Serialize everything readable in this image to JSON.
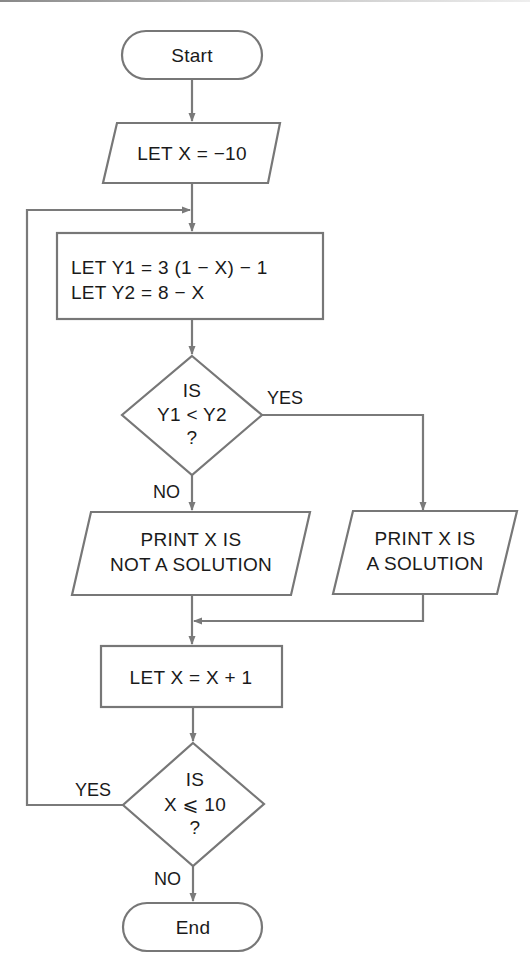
{
  "diagram": {
    "type": "flowchart",
    "colors": {
      "stroke": "#777777",
      "text": "#1a1a1a",
      "background": "#ffffff"
    },
    "nodes": {
      "start": {
        "shape": "terminal",
        "label": "Start"
      },
      "init": {
        "shape": "parallelogram",
        "label": "LET X = −10"
      },
      "compute": {
        "shape": "rectangle",
        "lines": [
          "LET Y1 = 3 (1 − X) − 1",
          "LET Y2 = 8 − X"
        ]
      },
      "decision1": {
        "shape": "diamond",
        "lines": [
          "IS",
          "Y1 < Y2",
          "?"
        ]
      },
      "not_solution": {
        "shape": "parallelogram",
        "lines": [
          "PRINT X IS",
          "NOT A SOLUTION"
        ]
      },
      "solution": {
        "shape": "parallelogram",
        "lines": [
          "PRINT X IS",
          "A SOLUTION"
        ]
      },
      "increment": {
        "shape": "rectangle",
        "label": "LET X = X + 1"
      },
      "decision2": {
        "shape": "diamond",
        "lines": [
          "IS",
          "X ⩽ 10",
          "?"
        ]
      },
      "end": {
        "shape": "terminal",
        "label": "End"
      }
    },
    "edge_labels": {
      "decision1_yes": "YES",
      "decision1_no": "NO",
      "decision2_yes": "YES",
      "decision2_no": "NO"
    },
    "edges": [
      {
        "from": "start",
        "to": "init"
      },
      {
        "from": "init",
        "to": "compute"
      },
      {
        "from": "compute",
        "to": "decision1"
      },
      {
        "from": "decision1",
        "to": "solution",
        "label": "YES"
      },
      {
        "from": "decision1",
        "to": "not_solution",
        "label": "NO"
      },
      {
        "from": "not_solution",
        "to": "increment"
      },
      {
        "from": "solution",
        "to": "increment"
      },
      {
        "from": "increment",
        "to": "decision2"
      },
      {
        "from": "decision2",
        "to": "compute",
        "label": "YES"
      },
      {
        "from": "decision2",
        "to": "end",
        "label": "NO"
      }
    ]
  }
}
